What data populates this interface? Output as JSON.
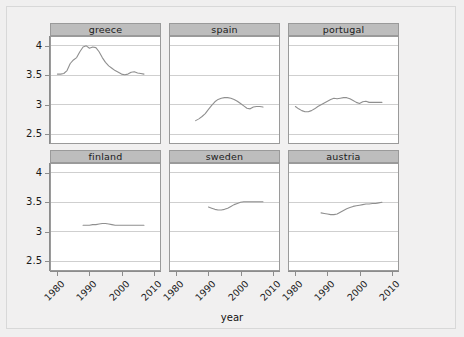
{
  "chart_data": {
    "type": "line",
    "title": "",
    "xlabel": "year",
    "ylabel": "",
    "xlim": [
      1978,
      2012
    ],
    "ylim": [
      2.35,
      4.15
    ],
    "xticks": [
      1980,
      1990,
      2000,
      2010
    ],
    "xticklabels": [
      "1980",
      "1990",
      "2000",
      "2010"
    ],
    "yticks": [
      2.5,
      3,
      3.5,
      4
    ],
    "yticklabels": [
      "2.5",
      "3",
      "3.5",
      "4"
    ],
    "grid": true,
    "grid_axis": "y",
    "legend": "none",
    "layout": "facet-grid 2 rows x 3 cols, strip labels on top",
    "panels": [
      {
        "label": "greece",
        "row": 0,
        "col": 0,
        "x": [
          1980,
          1981,
          1982,
          1983,
          1984,
          1985,
          1986,
          1987,
          1988,
          1989,
          1990,
          1991,
          1992,
          1993,
          1994,
          1995,
          1996,
          1997,
          1998,
          1999,
          2000,
          2001,
          2002,
          2003,
          2004,
          2005,
          2006,
          2007
        ],
        "y": [
          3.52,
          3.52,
          3.53,
          3.58,
          3.7,
          3.76,
          3.8,
          3.9,
          3.98,
          4.0,
          3.96,
          3.98,
          3.97,
          3.9,
          3.8,
          3.72,
          3.66,
          3.62,
          3.58,
          3.55,
          3.52,
          3.51,
          3.52,
          3.55,
          3.56,
          3.54,
          3.53,
          3.52
        ]
      },
      {
        "label": "spain",
        "row": 0,
        "col": 1,
        "x": [
          1986,
          1987,
          1988,
          1989,
          1990,
          1991,
          1992,
          1993,
          1994,
          1995,
          1996,
          1997,
          1998,
          1999,
          2000,
          2001,
          2002,
          2003,
          2004,
          2005,
          2006,
          2007
        ],
        "y": [
          2.73,
          2.76,
          2.8,
          2.85,
          2.92,
          2.99,
          3.05,
          3.09,
          3.11,
          3.12,
          3.12,
          3.11,
          3.09,
          3.06,
          3.02,
          2.98,
          2.94,
          2.93,
          2.96,
          2.97,
          2.97,
          2.96
        ]
      },
      {
        "label": "portugal",
        "row": 0,
        "col": 2,
        "x": [
          1980,
          1981,
          1982,
          1983,
          1984,
          1985,
          1986,
          1987,
          1988,
          1989,
          1990,
          1991,
          1992,
          1993,
          1994,
          1995,
          1996,
          1997,
          1998,
          1999,
          2000,
          2001,
          2002,
          2003,
          2004,
          2005,
          2006,
          2007
        ],
        "y": [
          2.97,
          2.93,
          2.9,
          2.88,
          2.88,
          2.9,
          2.93,
          2.97,
          3.0,
          3.03,
          3.06,
          3.09,
          3.11,
          3.1,
          3.11,
          3.12,
          3.12,
          3.1,
          3.07,
          3.04,
          3.02,
          3.05,
          3.06,
          3.04,
          3.04,
          3.04,
          3.04,
          3.04
        ]
      },
      {
        "label": "finland",
        "row": 1,
        "col": 0,
        "x": [
          1988,
          1989,
          1990,
          1991,
          1992,
          1993,
          1994,
          1995,
          1996,
          1997,
          1998,
          1999,
          2000,
          2001,
          2002,
          2003,
          2004,
          2005,
          2006,
          2007
        ],
        "y": [
          3.11,
          3.11,
          3.11,
          3.12,
          3.12,
          3.13,
          3.14,
          3.14,
          3.13,
          3.12,
          3.11,
          3.11,
          3.11,
          3.11,
          3.11,
          3.11,
          3.11,
          3.11,
          3.11,
          3.11
        ]
      },
      {
        "label": "sweden",
        "row": 1,
        "col": 1,
        "x": [
          1990,
          1991,
          1992,
          1993,
          1994,
          1995,
          1996,
          1997,
          1998,
          1999,
          2000,
          2001,
          2002,
          2003,
          2004,
          2005,
          2006,
          2007
        ],
        "y": [
          3.42,
          3.4,
          3.38,
          3.37,
          3.37,
          3.38,
          3.4,
          3.43,
          3.46,
          3.48,
          3.5,
          3.51,
          3.51,
          3.51,
          3.51,
          3.51,
          3.51,
          3.51
        ]
      },
      {
        "label": "austria",
        "row": 1,
        "col": 2,
        "x": [
          1988,
          1989,
          1990,
          1991,
          1992,
          1993,
          1994,
          1995,
          1996,
          1997,
          1998,
          1999,
          2000,
          2001,
          2002,
          2003,
          2004,
          2005,
          2006,
          2007
        ],
        "y": [
          3.32,
          3.31,
          3.3,
          3.29,
          3.29,
          3.3,
          3.33,
          3.36,
          3.39,
          3.41,
          3.43,
          3.44,
          3.45,
          3.46,
          3.47,
          3.47,
          3.48,
          3.48,
          3.49,
          3.5
        ]
      }
    ],
    "colors": {
      "line": "#8f8f8f",
      "grid": "#cfcfcf",
      "strip_background": "#bdbdbd",
      "panel_background": "#ffffff",
      "panel_border": "#9a9a9a",
      "figure_background": "#f1f0f0",
      "text": "#1a1a1a"
    }
  }
}
